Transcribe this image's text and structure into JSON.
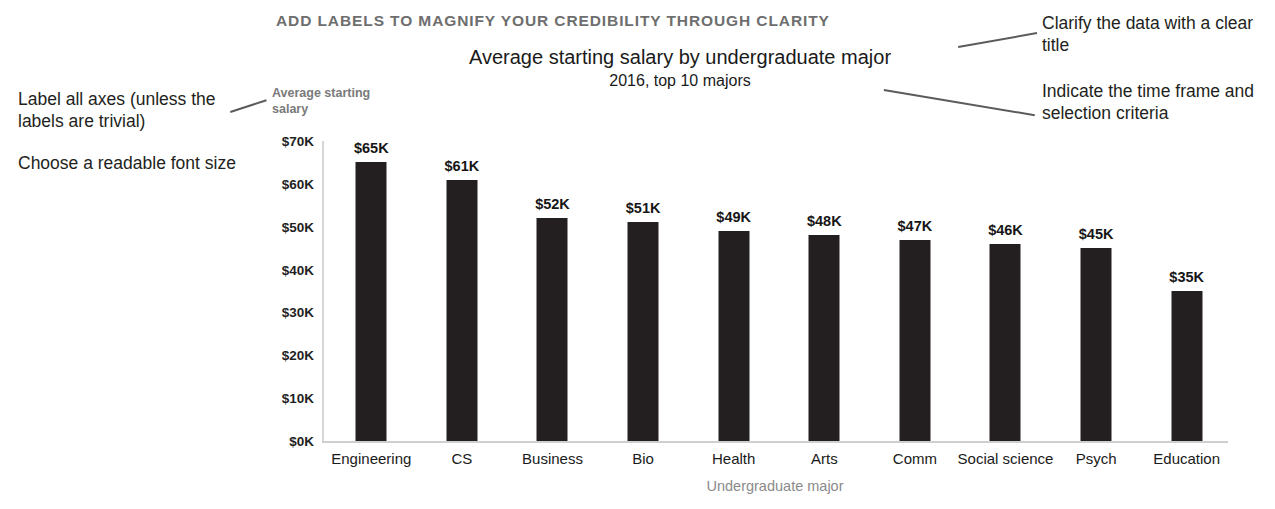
{
  "headline": "ADD LABELS TO MAGNIFY YOUR CREDIBILITY THROUGH CLARITY",
  "annotations": {
    "left_1": "Label all axes (unless the labels are trivial)",
    "left_2": "Choose a readable font size",
    "right_1": "Clarify the data with a clear title",
    "right_2": "Indicate the time frame and selection criteria"
  },
  "chart_data": {
    "type": "bar",
    "title": "Average starting salary by undergraduate major",
    "subtitle": "2016, top 10 majors",
    "xlabel": "Undergraduate major",
    "ylabel": "Average starting salary",
    "categories": [
      "Engineering",
      "CS",
      "Business",
      "Bio",
      "Health",
      "Arts",
      "Comm",
      "Social science",
      "Psych",
      "Education"
    ],
    "values": [
      65,
      61,
      52,
      51,
      49,
      48,
      47,
      46,
      45,
      35
    ],
    "value_labels": [
      "$65K",
      "$61K",
      "$52K",
      "$51K",
      "$49K",
      "$48K",
      "$47K",
      "$46K",
      "$45K",
      "$35K"
    ],
    "ylim": [
      0,
      70
    ],
    "yticks": [
      70,
      60,
      50,
      40,
      30,
      20,
      10,
      0
    ],
    "ytick_labels": [
      "$70K",
      "$60K",
      "$50K",
      "$40K",
      "$30K",
      "$20K",
      "$10K",
      "$0K"
    ],
    "grid": false,
    "legend": "none",
    "bar_color": "#231f20"
  }
}
